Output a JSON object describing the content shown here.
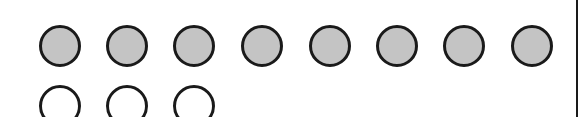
{
  "diagram": {
    "colors": {
      "filled": "#c4c4c4",
      "empty": "#ffffff",
      "stroke": "#1a1a1a",
      "border": "#1a1a1a"
    },
    "circle_diameter": 42,
    "rows": [
      {
        "name": "filled-row",
        "count": 8,
        "style": "filled",
        "top": 25,
        "centers_x": [
          60,
          127,
          194,
          262,
          330,
          397,
          464,
          532
        ]
      },
      {
        "name": "empty-row",
        "count": 3,
        "style": "empty",
        "top": 85,
        "centers_x": [
          60,
          127,
          194
        ]
      }
    ]
  }
}
